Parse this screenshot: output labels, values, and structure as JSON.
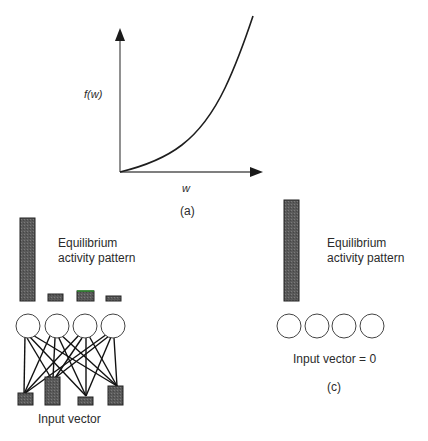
{
  "panel_a": {
    "y_label": "f(w)",
    "x_label": "w",
    "caption": "(a)",
    "curve": "convex increasing, starting at origin"
  },
  "panel_b": {
    "title_line1": "Equilibrium",
    "title_line2": "activity pattern",
    "output_bars": [
      85,
      8,
      11,
      6
    ],
    "input_bars": [
      12,
      28,
      8,
      22
    ],
    "input_label": "Input vector",
    "units": 4,
    "connections": "fully connected"
  },
  "panel_c": {
    "title_line1": "Equilibrium",
    "title_line2": "activity pattern",
    "output_bars": [
      103,
      0,
      0,
      0
    ],
    "input_label": "Input vector = 0",
    "caption": "(c)",
    "units": 4
  },
  "colors": {
    "bar_fill": "#555555",
    "stroke": "#1e1e1e",
    "highlight": "#2e8b2e"
  }
}
